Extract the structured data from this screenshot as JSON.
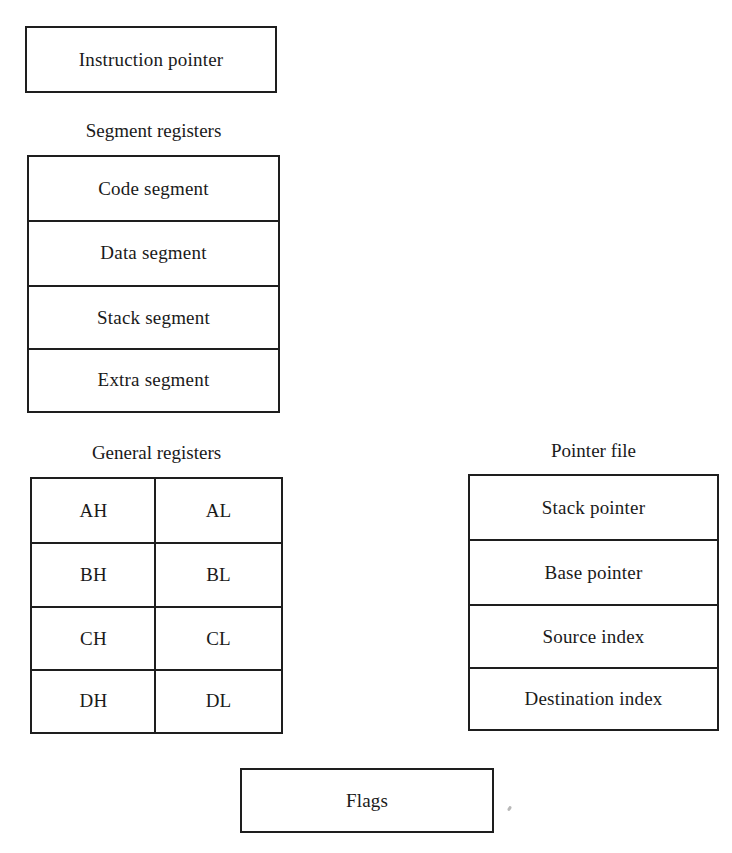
{
  "diagram": {
    "type": "register-set",
    "instruction_pointer": {
      "label": "Instruction pointer"
    },
    "segment_registers": {
      "title": "Segment registers",
      "rows": [
        "Code segment",
        "Data segment",
        "Stack segment",
        "Extra segment"
      ]
    },
    "general_registers": {
      "title": "General registers",
      "rows": [
        [
          "AH",
          "AL"
        ],
        [
          "BH",
          "BL"
        ],
        [
          "CH",
          "CL"
        ],
        [
          "DH",
          "DL"
        ]
      ]
    },
    "pointer_file": {
      "title": "Pointer file",
      "rows": [
        "Stack pointer",
        "Base pointer",
        "Source index",
        "Destination index"
      ]
    },
    "flags": {
      "label": "Flags"
    }
  },
  "colors": {
    "stroke": "#1e1e1e",
    "text": "#1a1a1a",
    "background": "#ffffff"
  }
}
